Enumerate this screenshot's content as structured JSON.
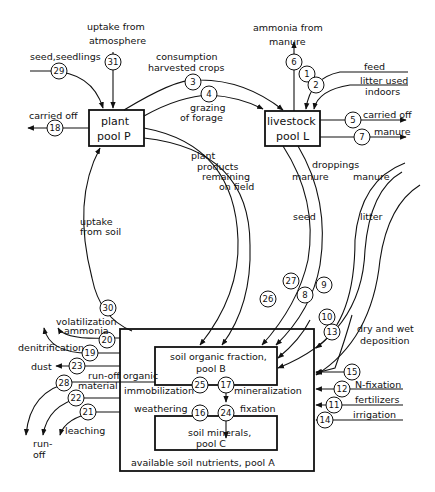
{
  "diagram": {
    "pools": {
      "plant": {
        "line1": "plant",
        "line2": "pool P"
      },
      "livestock": {
        "line1": "livestock",
        "line2": "pool L"
      },
      "soil_organic": {
        "line1": "soil organic fraction,",
        "line2": "pool B"
      },
      "soil_minerals": {
        "line1": "soil minerals,",
        "line2": "pool C"
      },
      "available": {
        "label": "available soil nutrients, pool  A"
      }
    },
    "flows": {
      "f1": "1",
      "f2": "2",
      "f3": "3",
      "f4": "4",
      "f5": "5",
      "f6": "6",
      "f7": "7",
      "f8": "8",
      "f9": "9",
      "f10": "10",
      "f11": "11",
      "f12": "12",
      "f13": "13",
      "f14": "14",
      "f15": "15",
      "f16": "16",
      "f17": "17",
      "f18": "18",
      "f19": "19",
      "f20": "20",
      "f21": "21",
      "f22": "22",
      "f23": "23",
      "f24": "24",
      "f25": "25",
      "f26": "26",
      "f27": "27",
      "f28": "28",
      "f29": "29",
      "f30": "30",
      "f31": "31"
    },
    "labels": {
      "uptake_atm_1": "uptake from",
      "uptake_atm_2": "atmosphere",
      "seed_seedlings": "seed,seedlings",
      "consumption_1": "consumption",
      "consumption_2": "harvested crops",
      "grazing_1": "grazing",
      "grazing_2": "of forage",
      "carried_off_p": "carried off",
      "ammonia_manure_1": "ammonia from",
      "ammonia_manure_2": "manure",
      "feed": "feed",
      "litter_used_1": "litter used",
      "litter_used_2": "indoors",
      "carried_off_l": "carried off",
      "manure_out": "manure",
      "plant_products_1": "plant",
      "plant_products_2": "products",
      "plant_products_3": "remaining",
      "plant_products_4": "on field",
      "droppings": "droppings",
      "manure_a": "manure",
      "manure_b": "manure",
      "seed": "seed",
      "litter": "litter",
      "uptake_soil_1": "uptake",
      "uptake_soil_2": "from soil",
      "volatilization_1": "volatilization",
      "volatilization_2": "ammonia",
      "denitrification": "denitrification",
      "dust": "dust",
      "runoff_organic_1": "run-off organic",
      "runoff_organic_2": "material",
      "runoff_1": "run-",
      "runoff_2": "off",
      "leaching": "leaching",
      "immobilization": "immobilization",
      "mineralization": "mineralization",
      "weathering": "weathering",
      "fixation": "fixation",
      "deposition_1": "dry and wet",
      "deposition_2": "deposition",
      "n_fixation": "N-fixation",
      "fertilizers": "fertilizers",
      "irrigation": "irrigation"
    }
  }
}
